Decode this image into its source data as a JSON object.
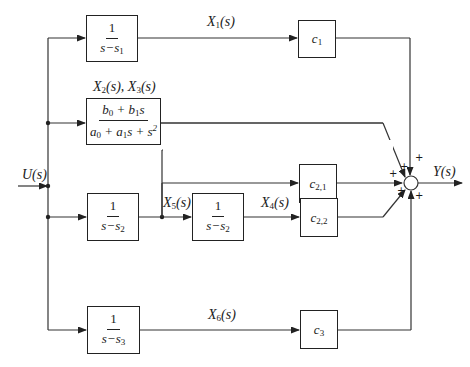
{
  "diagram": {
    "type": "block-diagram",
    "input": {
      "label": "U(s)"
    },
    "output": {
      "label": "Y(s)"
    },
    "blocks": [
      {
        "id": "tf1",
        "numerator": "1",
        "denominator": "s−s",
        "den_sub": "1"
      },
      {
        "id": "tf2",
        "numerator": "b",
        "num_parts": [
          "b",
          "0",
          " + b",
          "1",
          "s"
        ],
        "denominator_parts": [
          "a",
          "0",
          " + a",
          "1",
          "s + s",
          "2"
        ]
      },
      {
        "id": "tf3",
        "numerator": "1",
        "denominator": "s−s",
        "den_sub": "2"
      },
      {
        "id": "tf4",
        "numerator": "1",
        "denominator": "s−s",
        "den_sub": "2"
      },
      {
        "id": "tf5",
        "numerator": "1",
        "denominator": "s−s",
        "den_sub": "3"
      }
    ],
    "gains": [
      {
        "id": "c1",
        "base": "c",
        "sub": "1"
      },
      {
        "id": "c21",
        "base": "c",
        "sub": "2,1"
      },
      {
        "id": "c22",
        "base": "c",
        "sub": "2,2"
      },
      {
        "id": "c3",
        "base": "c",
        "sub": "3"
      }
    ],
    "signals": [
      {
        "id": "x1",
        "base": "X",
        "sub": "1",
        "suffix": "(s)"
      },
      {
        "id": "x23",
        "text_a": "X",
        "sub_a": "2",
        "mid": "(s), X",
        "sub_b": "3",
        "suffix": "(s)"
      },
      {
        "id": "x5",
        "base": "X",
        "sub": "5",
        "suffix": "(s)"
      },
      {
        "id": "x4",
        "base": "X",
        "sub": "4",
        "suffix": "(s)"
      },
      {
        "id": "x6",
        "base": "X",
        "sub": "6",
        "suffix": "(s)"
      }
    ],
    "summing_junction": {
      "signs": [
        "+",
        "+",
        "+",
        "+",
        "+"
      ]
    }
  }
}
